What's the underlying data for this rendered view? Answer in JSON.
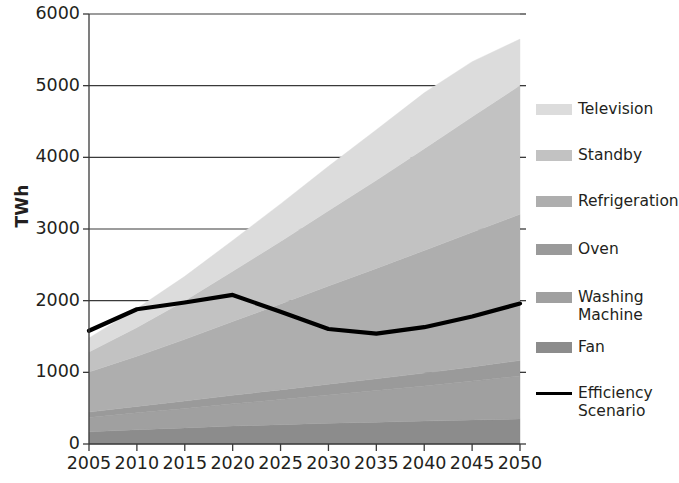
{
  "chart_data": {
    "type": "area",
    "title": "",
    "subtitle": "",
    "xlabel": "",
    "ylabel": "TWh",
    "x": [
      2005,
      2010,
      2015,
      2020,
      2025,
      2030,
      2035,
      2040,
      2045,
      2050
    ],
    "categories": [
      "2005",
      "2010",
      "2015",
      "2020",
      "2025",
      "2030",
      "2035",
      "2040",
      "2045",
      "2050"
    ],
    "xlim": [
      2005,
      2050
    ],
    "ylim": [
      0,
      6000
    ],
    "yticks": [
      0,
      1000,
      2000,
      3000,
      4000,
      5000,
      6000
    ],
    "ytick_labels": [
      "0",
      "1000",
      "2000",
      "3000",
      "4000",
      "5000",
      "6000"
    ],
    "grid": "horizontal",
    "stacked": true,
    "legend_position": "right",
    "series": [
      {
        "name": "Fan",
        "type": "area",
        "color": "#8c8c8c",
        "values": [
          170,
          200,
          225,
          250,
          270,
          290,
          305,
          320,
          335,
          350
        ]
      },
      {
        "name": "Washing Machine",
        "type": "area",
        "color": "#a0a0a0",
        "values": [
          200,
          235,
          270,
          310,
          350,
          395,
          440,
          490,
          545,
          600
        ]
      },
      {
        "name": "Oven",
        "type": "area",
        "color": "#9a9a9a",
        "values": [
          75,
          90,
          105,
          120,
          135,
          150,
          165,
          180,
          195,
          215
        ]
      },
      {
        "name": "Refrigeration",
        "type": "area",
        "color": "#aeaeae",
        "values": [
          560,
          700,
          860,
          1030,
          1200,
          1370,
          1540,
          1710,
          1880,
          2040
        ]
      },
      {
        "name": "Standby",
        "type": "area",
        "color": "#c2c2c2",
        "values": [
          280,
          400,
          540,
          700,
          870,
          1050,
          1230,
          1420,
          1610,
          1800
        ]
      },
      {
        "name": "Television",
        "type": "area",
        "color": "#dcdcdc",
        "values": [
          195,
          265,
          340,
          430,
          525,
          620,
          705,
          780,
          770,
          645
        ]
      }
    ],
    "stack_totals": [
      1480,
      1890,
      2340,
      2840,
      3350,
      3875,
      4385,
      4900,
      5335,
      5650
    ],
    "line_series": {
      "name": "Efficiency Scenario",
      "type": "line",
      "color": "#000000",
      "values": [
        1580,
        1880,
        1975,
        2080,
        1845,
        1605,
        1540,
        1630,
        1780,
        1960
      ]
    },
    "legend": [
      {
        "label": "Television",
        "color": "#dcdcdc",
        "marker": "swatch"
      },
      {
        "label": "Standby",
        "color": "#c2c2c2",
        "marker": "swatch"
      },
      {
        "label": "Refrigeration",
        "color": "#aeaeae",
        "marker": "swatch"
      },
      {
        "label": "Oven",
        "color": "#9a9a9a",
        "marker": "swatch"
      },
      {
        "label": "Washing\nMachine",
        "color": "#a0a0a0",
        "marker": "swatch"
      },
      {
        "label": "Fan",
        "color": "#8c8c8c",
        "marker": "swatch"
      },
      {
        "label": "Efficiency\nScenario",
        "color": "#000000",
        "marker": "line"
      }
    ]
  }
}
